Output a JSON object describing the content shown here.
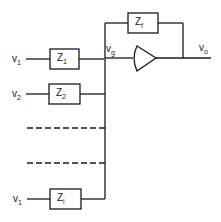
{
  "diagram": {
    "type": "summing-amplifier-circuit",
    "inputs": [
      {
        "voltage": "v",
        "voltage_sub": "1",
        "impedance": "Z",
        "impedance_sub": "1"
      },
      {
        "voltage": "v",
        "voltage_sub": "2",
        "impedance": "Z",
        "impedance_sub": "2"
      },
      {
        "voltage": "v",
        "voltage_sub": "1",
        "impedance": "Z",
        "impedance_sub": "i"
      }
    ],
    "feedback": {
      "impedance": "Z",
      "impedance_sub": "f"
    },
    "node": {
      "label": "v",
      "sub": "g"
    },
    "output": {
      "label": "v",
      "sub": "o"
    },
    "colors": {
      "line": "#1a1a1a",
      "background": "#ffffff"
    }
  }
}
